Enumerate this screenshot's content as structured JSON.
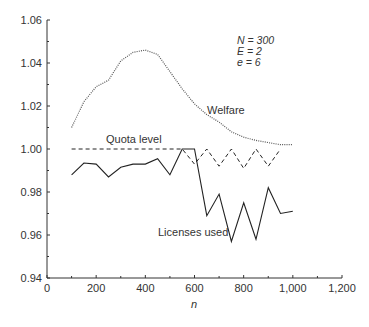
{
  "chart_data": {
    "type": "line",
    "title": "",
    "xlabel": "n",
    "ylabel": "",
    "xlim": [
      0,
      1200
    ],
    "ylim": [
      0.94,
      1.06
    ],
    "x_ticks": [
      0,
      200,
      400,
      600,
      800,
      1000,
      1200
    ],
    "x_tick_labels": [
      "0",
      "200",
      "400",
      "600",
      "800",
      "1,000",
      "1,200"
    ],
    "y_ticks": [
      0.94,
      0.96,
      0.98,
      1.0,
      1.02,
      1.04,
      1.06
    ],
    "y_tick_labels": [
      "0.94",
      "0.96",
      "0.98",
      "1.00",
      "1.02",
      "1.04",
      "1.06"
    ],
    "grid": false,
    "annotations": [
      "N = 300",
      "E = 2",
      "e = 6"
    ],
    "series": [
      {
        "name": "Welfare",
        "style": "dotted",
        "x": [
          100,
          150,
          200,
          250,
          300,
          350,
          400,
          450,
          500,
          550,
          600,
          650,
          700,
          750,
          800,
          850,
          900,
          950,
          1000
        ],
        "values": [
          1.01,
          1.022,
          1.029,
          1.032,
          1.041,
          1.045,
          1.046,
          1.044,
          1.036,
          1.028,
          1.021,
          1.016,
          1.0125,
          1.008,
          1.0055,
          1.004,
          1.003,
          1.002,
          1.002
        ]
      },
      {
        "name": "Quota level",
        "style": "dashed",
        "x": [
          100,
          150,
          200,
          250,
          300,
          350,
          400,
          450,
          500,
          550,
          600,
          650,
          700,
          750,
          800,
          850,
          900,
          950
        ],
        "values": [
          1.0,
          1.0,
          1.0,
          1.0,
          1.0,
          1.0,
          1.0,
          1.0,
          1.0,
          1.0,
          0.993,
          1.0,
          0.992,
          1.0,
          0.991,
          1.0,
          0.992,
          1.0
        ]
      },
      {
        "name": "Licenses used",
        "style": "solid",
        "x": [
          100,
          150,
          200,
          250,
          300,
          350,
          400,
          450,
          500,
          550,
          600,
          650,
          700,
          750,
          800,
          850,
          900,
          950,
          1000
        ],
        "values": [
          0.988,
          0.9935,
          0.993,
          0.987,
          0.9915,
          0.993,
          0.993,
          0.9955,
          0.988,
          1.0,
          1.0,
          0.969,
          0.979,
          0.957,
          0.975,
          0.958,
          0.982,
          0.97,
          0.971
        ]
      }
    ],
    "series_labels": [
      {
        "text": "Welfare",
        "x": 690,
        "y": 1.023
      },
      {
        "text": "Quota level",
        "x": 280,
        "y": 1.003
      },
      {
        "text": "Licenses used",
        "x": 640,
        "y": 0.954
      }
    ]
  },
  "labels": {
    "xlabel": "n",
    "annotation_lines": [
      "N = 300",
      "E = 2",
      "e = 6"
    ],
    "welfare": "Welfare",
    "quota": "Quota level",
    "licenses": "Licenses used"
  }
}
